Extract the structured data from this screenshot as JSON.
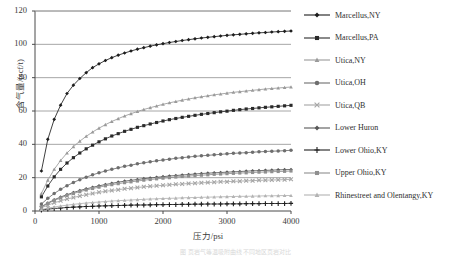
{
  "figure": {
    "caption_faint": "图 页岩气等温吸附曲线 不同地区页岩对比"
  },
  "chart_data": {
    "type": "line",
    "title": "",
    "xlabel": "压力/psi",
    "ylabel": "含气量/(scf/t)",
    "xlim": [
      0,
      4000
    ],
    "ylim": [
      0,
      120
    ],
    "xticks": [
      "0",
      "1000",
      "2000",
      "3000",
      "4000"
    ],
    "yticks": [
      "0",
      "20",
      "40",
      "60",
      "80",
      "100",
      "120"
    ],
    "grid": "horizontal",
    "legend_position": "right",
    "x": [
      100,
      200,
      300,
      400,
      500,
      600,
      700,
      800,
      900,
      1000,
      1100,
      1200,
      1300,
      1400,
      1500,
      1600,
      1700,
      1800,
      1900,
      2000,
      2100,
      2200,
      2300,
      2400,
      2500,
      2600,
      2700,
      2800,
      2900,
      3000,
      3100,
      3200,
      3300,
      3400,
      3500,
      3600,
      3700,
      3800,
      3900,
      4000
    ],
    "series": [
      {
        "name": "Marcellus,NY",
        "marker": "diamond",
        "color": "#1d1d1d",
        "values": [
          24.0,
          43.0,
          55.0,
          63.5,
          70.5,
          75.5,
          79.5,
          83.0,
          86.0,
          88.3,
          90.3,
          92.0,
          93.5,
          94.8,
          96.0,
          97.1,
          98.0,
          98.9,
          99.7,
          100.4,
          101.1,
          101.7,
          102.3,
          102.8,
          103.3,
          103.8,
          104.2,
          104.6,
          105.0,
          105.4,
          105.7,
          106.0,
          106.3,
          106.6,
          106.9,
          107.1,
          107.4,
          107.6,
          107.8,
          108.0
        ]
      },
      {
        "name": "Marcellus,PA",
        "marker": "square",
        "color": "#2a2a2a",
        "values": [
          8.5,
          15.0,
          20.5,
          25.0,
          28.8,
          32.0,
          34.8,
          37.3,
          39.5,
          41.5,
          43.3,
          45.0,
          46.4,
          47.8,
          49.0,
          50.2,
          51.2,
          52.2,
          53.1,
          54.0,
          54.8,
          55.5,
          56.2,
          56.8,
          57.4,
          58.0,
          58.5,
          59.0,
          59.5,
          59.9,
          60.4,
          60.8,
          61.2,
          61.5,
          61.9,
          62.2,
          62.5,
          62.8,
          63.1,
          63.4
        ]
      },
      {
        "name": "Utica,NY",
        "marker": "triangle",
        "color": "#9a9a9a",
        "values": [
          10.5,
          18.5,
          25.0,
          30.3,
          34.8,
          38.6,
          41.9,
          44.8,
          47.4,
          49.7,
          51.8,
          53.7,
          55.4,
          57.0,
          58.4,
          59.7,
          60.9,
          62.0,
          63.0,
          64.0,
          64.9,
          65.7,
          66.5,
          67.2,
          67.9,
          68.5,
          69.1,
          69.7,
          70.2,
          70.7,
          71.2,
          71.6,
          72.0,
          72.4,
          72.8,
          73.2,
          73.5,
          73.8,
          74.1,
          74.4
        ]
      },
      {
        "name": "Utica,OH",
        "marker": "circle",
        "color": "#6e6e6e",
        "values": [
          4.2,
          7.6,
          10.5,
          13.0,
          15.2,
          17.1,
          18.8,
          20.3,
          21.7,
          22.9,
          24.0,
          25.0,
          25.9,
          26.8,
          27.5,
          28.3,
          28.9,
          29.5,
          30.1,
          30.6,
          31.1,
          31.6,
          32.0,
          32.4,
          32.8,
          33.1,
          33.4,
          33.7,
          34.0,
          34.3,
          34.6,
          34.8,
          35.0,
          35.3,
          35.5,
          35.7,
          35.9,
          36.0,
          36.2,
          36.4
        ]
      },
      {
        "name": "Utica,QB",
        "marker": "cross-x",
        "color": "#a5a5a5",
        "values": [
          1.9,
          3.5,
          4.9,
          6.1,
          7.2,
          8.1,
          9.0,
          9.8,
          10.5,
          11.2,
          11.8,
          12.3,
          12.8,
          13.3,
          13.7,
          14.1,
          14.5,
          14.8,
          15.1,
          15.4,
          15.7,
          16.0,
          16.2,
          16.5,
          16.7,
          16.9,
          17.1,
          17.3,
          17.5,
          17.6,
          17.8,
          17.9,
          18.1,
          18.2,
          18.4,
          18.5,
          18.6,
          18.7,
          18.8,
          19.0
        ]
      },
      {
        "name": "Lower Huron",
        "marker": "diamond",
        "color": "#585858",
        "values": [
          2.6,
          4.8,
          6.7,
          8.4,
          9.8,
          11.1,
          12.3,
          13.3,
          14.2,
          15.1,
          15.9,
          16.6,
          17.3,
          17.9,
          18.4,
          18.9,
          19.4,
          19.8,
          20.2,
          20.6,
          21.0,
          21.3,
          21.6,
          21.9,
          22.2,
          22.5,
          22.7,
          22.9,
          23.1,
          23.3,
          23.5,
          23.7,
          23.9,
          24.1,
          24.2,
          24.4,
          24.5,
          24.7,
          24.8,
          24.9
        ]
      },
      {
        "name": "Lower Ohio,KY",
        "marker": "plus",
        "color": "#1f1f1f",
        "values": [
          0.6,
          1.1,
          1.5,
          1.8,
          2.1,
          2.3,
          2.5,
          2.7,
          2.8,
          3.0,
          3.1,
          3.2,
          3.3,
          3.4,
          3.5,
          3.6,
          3.6,
          3.7,
          3.8,
          3.8,
          3.9,
          3.9,
          4.0,
          4.0,
          4.1,
          4.1,
          4.2,
          4.2,
          4.2,
          4.3,
          4.3,
          4.3,
          4.4,
          4.4,
          4.4,
          4.5,
          4.5,
          4.5,
          4.5,
          4.6
        ]
      },
      {
        "name": "Upper Ohio,KY",
        "marker": "square",
        "color": "#8f8f8f",
        "values": [
          2.4,
          4.5,
          6.3,
          7.9,
          9.3,
          10.5,
          11.6,
          12.6,
          13.5,
          14.3,
          15.1,
          15.8,
          16.4,
          17.0,
          17.5,
          18.0,
          18.5,
          18.9,
          19.3,
          19.7,
          20.0,
          20.4,
          20.7,
          21.0,
          21.2,
          21.5,
          21.7,
          22.0,
          22.2,
          22.4,
          22.6,
          22.8,
          22.9,
          23.1,
          23.3,
          23.4,
          23.6,
          23.7,
          23.8,
          24.0
        ]
      },
      {
        "name": "Rhinestreet and Olentangy,KY",
        "marker": "triangle",
        "color": "#b3b3b3",
        "values": [
          0.9,
          1.7,
          2.4,
          3.0,
          3.5,
          4.0,
          4.4,
          4.8,
          5.1,
          5.4,
          5.7,
          6.0,
          6.2,
          6.4,
          6.6,
          6.8,
          7.0,
          7.2,
          7.3,
          7.5,
          7.6,
          7.7,
          7.9,
          8.0,
          8.1,
          8.2,
          8.3,
          8.4,
          8.5,
          8.6,
          8.7,
          8.8,
          8.8,
          8.9,
          9.0,
          9.1,
          9.1,
          9.2,
          9.3,
          9.3
        ]
      }
    ]
  },
  "legend": {
    "items": [
      {
        "label": "Marcellus,NY"
      },
      {
        "label": "Marcellus,PA"
      },
      {
        "label": "Utica,NY"
      },
      {
        "label": "Utica,OH"
      },
      {
        "label": "Utica,QB"
      },
      {
        "label": "Lower Huron"
      },
      {
        "label": "Lower Ohio,KY"
      },
      {
        "label": "Upper Ohio,KY"
      },
      {
        "label": "Rhinestreet and Olentangy,KY"
      }
    ]
  }
}
